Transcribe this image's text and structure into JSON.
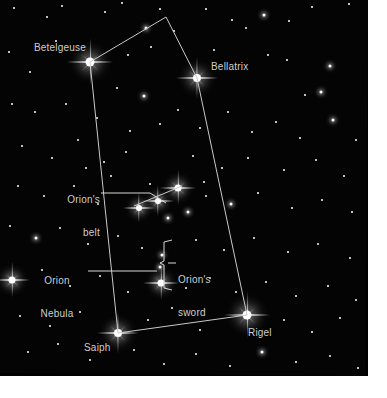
{
  "image": {
    "title": "Orion constellation star chart",
    "background_color": "#000000",
    "border_color": "#ffffff",
    "label_color": "#cfcfcf",
    "line_color": "#c9c9c9",
    "sky_width": 368,
    "sky_height": 376
  },
  "labels": {
    "betelgeuse": "Betelgeuse",
    "bellatrix": "Bellatrix",
    "rigel": "Rigel",
    "saiph": "Saiph",
    "orions_belt_line1": "Orion's",
    "orions_belt_line2": "belt",
    "orions_sword_line1": "Orion's",
    "orions_sword_line2": "sword",
    "orion_nebula_line1": "Orion",
    "orion_nebula_line2": "Nebula"
  },
  "chart_data": {
    "type": "scatter",
    "xlabel": "",
    "ylabel": "",
    "xlim": [
      0,
      368
    ],
    "ylim": [
      0,
      376
    ],
    "grid": false,
    "legend": "none",
    "named_stars": [
      {
        "name": "Betelgeuse",
        "x": 90,
        "y": 62,
        "magnitude_size": 9,
        "spikes": true
      },
      {
        "name": "Bellatrix",
        "x": 197,
        "y": 78,
        "magnitude_size": 8,
        "spikes": true
      },
      {
        "name": "Rigel",
        "x": 247,
        "y": 315,
        "magnitude_size": 9,
        "spikes": true
      },
      {
        "name": "Saiph",
        "x": 118,
        "y": 333,
        "magnitude_size": 8,
        "spikes": true
      },
      {
        "name": "Alnitak (belt)",
        "x": 178,
        "y": 188,
        "magnitude_size": 7,
        "spikes": true
      },
      {
        "name": "Alnilam (belt)",
        "x": 158,
        "y": 201,
        "magnitude_size": 6,
        "spikes": true
      },
      {
        "name": "Mintaka (belt)",
        "x": 139,
        "y": 208,
        "magnitude_size": 6,
        "spikes": true
      },
      {
        "name": "Orion Nebula (M42)",
        "x": 161,
        "y": 283,
        "magnitude_size": 7,
        "spikes": true
      },
      {
        "name": "Sword star upper",
        "x": 162,
        "y": 255,
        "magnitude_size": 3,
        "spikes": false
      },
      {
        "name": "Sword star mid",
        "x": 160,
        "y": 267,
        "magnitude_size": 3,
        "spikes": false
      }
    ],
    "constellation_lines": [
      {
        "from": "Betelgeuse",
        "to": "Apex",
        "x1": 90,
        "y1": 62,
        "x2": 166,
        "y2": 17
      },
      {
        "from": "Apex",
        "to": "Bellatrix",
        "x1": 166,
        "y1": 17,
        "x2": 197,
        "y2": 78
      },
      {
        "from": "Betelgeuse",
        "to": "Saiph",
        "x1": 90,
        "y1": 62,
        "x2": 118,
        "y2": 333
      },
      {
        "from": "Bellatrix",
        "to": "Rigel",
        "x1": 197,
        "y1": 78,
        "x2": 247,
        "y2": 315
      },
      {
        "from": "Saiph",
        "to": "Rigel",
        "x1": 118,
        "y1": 333,
        "x2": 247,
        "y2": 315
      },
      {
        "from": "Mintaka",
        "to": "Alnitak",
        "x1": 134,
        "y1": 206,
        "x2": 182,
        "y2": 186
      }
    ],
    "field_stars": [
      {
        "x": 14,
        "y": 8,
        "s": 2
      },
      {
        "x": 47,
        "y": 17,
        "s": 2
      },
      {
        "x": 62,
        "y": 6,
        "s": 2
      },
      {
        "x": 105,
        "y": 12,
        "s": 2
      },
      {
        "x": 122,
        "y": 3,
        "s": 2
      },
      {
        "x": 146,
        "y": 28,
        "s": 3
      },
      {
        "x": 160,
        "y": 9,
        "s": 2
      },
      {
        "x": 174,
        "y": 31,
        "s": 2
      },
      {
        "x": 206,
        "y": 9,
        "s": 2
      },
      {
        "x": 232,
        "y": 20,
        "s": 2
      },
      {
        "x": 246,
        "y": 28,
        "s": 2
      },
      {
        "x": 264,
        "y": 15,
        "s": 3
      },
      {
        "x": 289,
        "y": 21,
        "s": 2
      },
      {
        "x": 312,
        "y": 7,
        "s": 2
      },
      {
        "x": 349,
        "y": 4,
        "s": 2
      },
      {
        "x": 9,
        "y": 52,
        "s": 2
      },
      {
        "x": 30,
        "y": 72,
        "s": 2
      },
      {
        "x": 56,
        "y": 41,
        "s": 2
      },
      {
        "x": 128,
        "y": 55,
        "s": 2
      },
      {
        "x": 151,
        "y": 47,
        "s": 2
      },
      {
        "x": 117,
        "y": 88,
        "s": 2
      },
      {
        "x": 144,
        "y": 96,
        "s": 3
      },
      {
        "x": 178,
        "y": 110,
        "s": 2
      },
      {
        "x": 214,
        "y": 50,
        "s": 2
      },
      {
        "x": 268,
        "y": 55,
        "s": 2
      },
      {
        "x": 287,
        "y": 60,
        "s": 2
      },
      {
        "x": 330,
        "y": 66,
        "s": 3
      },
      {
        "x": 321,
        "y": 92,
        "s": 3
      },
      {
        "x": 305,
        "y": 95,
        "s": 2
      },
      {
        "x": 12,
        "y": 104,
        "s": 2
      },
      {
        "x": 35,
        "y": 112,
        "s": 2
      },
      {
        "x": 66,
        "y": 104,
        "s": 2
      },
      {
        "x": 97,
        "y": 118,
        "s": 2
      },
      {
        "x": 130,
        "y": 131,
        "s": 2
      },
      {
        "x": 160,
        "y": 124,
        "s": 2
      },
      {
        "x": 200,
        "y": 128,
        "s": 2
      },
      {
        "x": 228,
        "y": 112,
        "s": 2
      },
      {
        "x": 252,
        "y": 132,
        "s": 2
      },
      {
        "x": 276,
        "y": 122,
        "s": 2
      },
      {
        "x": 300,
        "y": 138,
        "s": 2
      },
      {
        "x": 333,
        "y": 120,
        "s": 3
      },
      {
        "x": 356,
        "y": 140,
        "s": 2
      },
      {
        "x": 22,
        "y": 146,
        "s": 2
      },
      {
        "x": 52,
        "y": 158,
        "s": 2
      },
      {
        "x": 78,
        "y": 140,
        "s": 2
      },
      {
        "x": 104,
        "y": 162,
        "s": 2
      },
      {
        "x": 126,
        "y": 152,
        "s": 2
      },
      {
        "x": 193,
        "y": 156,
        "s": 2
      },
      {
        "x": 222,
        "y": 168,
        "s": 2
      },
      {
        "x": 248,
        "y": 158,
        "s": 2
      },
      {
        "x": 284,
        "y": 170,
        "s": 2
      },
      {
        "x": 316,
        "y": 160,
        "s": 2
      },
      {
        "x": 344,
        "y": 176,
        "s": 2
      },
      {
        "x": 18,
        "y": 186,
        "s": 2
      },
      {
        "x": 44,
        "y": 196,
        "s": 2
      },
      {
        "x": 74,
        "y": 186,
        "s": 2
      },
      {
        "x": 98,
        "y": 204,
        "s": 2
      },
      {
        "x": 206,
        "y": 196,
        "s": 2
      },
      {
        "x": 231,
        "y": 204,
        "s": 3
      },
      {
        "x": 258,
        "y": 193,
        "s": 2
      },
      {
        "x": 292,
        "y": 208,
        "s": 2
      },
      {
        "x": 322,
        "y": 200,
        "s": 2
      },
      {
        "x": 352,
        "y": 212,
        "s": 2
      },
      {
        "x": 10,
        "y": 226,
        "s": 2
      },
      {
        "x": 36,
        "y": 238,
        "s": 3
      },
      {
        "x": 60,
        "y": 228,
        "s": 2
      },
      {
        "x": 88,
        "y": 244,
        "s": 2
      },
      {
        "x": 118,
        "y": 236,
        "s": 2
      },
      {
        "x": 142,
        "y": 248,
        "s": 2
      },
      {
        "x": 196,
        "y": 240,
        "s": 2
      },
      {
        "x": 224,
        "y": 250,
        "s": 2
      },
      {
        "x": 254,
        "y": 238,
        "s": 2
      },
      {
        "x": 288,
        "y": 252,
        "s": 2
      },
      {
        "x": 318,
        "y": 244,
        "s": 2
      },
      {
        "x": 350,
        "y": 258,
        "s": 2
      },
      {
        "x": 12,
        "y": 280,
        "s": 7,
        "spikes": true
      },
      {
        "x": 42,
        "y": 270,
        "s": 2
      },
      {
        "x": 70,
        "y": 286,
        "s": 2
      },
      {
        "x": 100,
        "y": 276,
        "s": 2
      },
      {
        "x": 128,
        "y": 292,
        "s": 2
      },
      {
        "x": 186,
        "y": 288,
        "s": 2
      },
      {
        "x": 210,
        "y": 278,
        "s": 2
      },
      {
        "x": 236,
        "y": 292,
        "s": 2
      },
      {
        "x": 266,
        "y": 282,
        "s": 2
      },
      {
        "x": 296,
        "y": 296,
        "s": 2
      },
      {
        "x": 328,
        "y": 286,
        "s": 2
      },
      {
        "x": 356,
        "y": 300,
        "s": 2
      },
      {
        "x": 20,
        "y": 316,
        "s": 2
      },
      {
        "x": 50,
        "y": 326,
        "s": 2
      },
      {
        "x": 80,
        "y": 312,
        "s": 2
      },
      {
        "x": 148,
        "y": 320,
        "s": 2
      },
      {
        "x": 172,
        "y": 308,
        "s": 2
      },
      {
        "x": 200,
        "y": 330,
        "s": 2
      },
      {
        "x": 284,
        "y": 320,
        "s": 2
      },
      {
        "x": 312,
        "y": 332,
        "s": 2
      },
      {
        "x": 340,
        "y": 318,
        "s": 2
      },
      {
        "x": 28,
        "y": 352,
        "s": 2
      },
      {
        "x": 58,
        "y": 344,
        "s": 2
      },
      {
        "x": 90,
        "y": 360,
        "s": 2
      },
      {
        "x": 134,
        "y": 350,
        "s": 2
      },
      {
        "x": 164,
        "y": 364,
        "s": 2
      },
      {
        "x": 196,
        "y": 354,
        "s": 2
      },
      {
        "x": 230,
        "y": 366,
        "s": 2
      },
      {
        "x": 262,
        "y": 352,
        "s": 3
      },
      {
        "x": 296,
        "y": 362,
        "s": 2
      },
      {
        "x": 330,
        "y": 356,
        "s": 2
      },
      {
        "x": 358,
        "y": 368,
        "s": 2
      },
      {
        "x": 111,
        "y": 176,
        "s": 2
      },
      {
        "x": 86,
        "y": 168,
        "s": 2
      },
      {
        "x": 168,
        "y": 218,
        "s": 3
      },
      {
        "x": 188,
        "y": 212,
        "s": 3
      },
      {
        "x": 204,
        "y": 182,
        "s": 2
      },
      {
        "x": 150,
        "y": 184,
        "s": 2
      }
    ]
  }
}
